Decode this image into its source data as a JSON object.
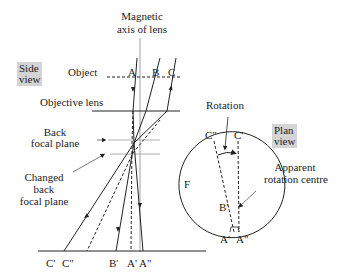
{
  "side_view": {
    "tag_line1": "Side",
    "tag_line2": "view",
    "axis_label_line1": "Magnetic",
    "axis_label_line2": "axis of lens",
    "object_label": "Object",
    "objective_lens_label": "Objective lens",
    "back_focal_plane_line1": "Back",
    "back_focal_plane_line2": "focal plane",
    "changed_bfp_line1": "Changed",
    "changed_bfp_line2": "back",
    "changed_bfp_line3": "focal plane",
    "object_points": [
      "A",
      "B",
      "C"
    ],
    "image_points": [
      "C'",
      "C\"",
      "B'",
      "A'",
      "A\""
    ]
  },
  "plan_view": {
    "tag_line1": "Plan",
    "tag_line2": "view",
    "rotation_label": "Rotation",
    "apparent_centre_line1": "Apparent",
    "apparent_centre_line2": "rotation centre",
    "circle_label": "F",
    "points": {
      "c_double": "C\"",
      "c_prime": "C'",
      "b_prime": "B'",
      "a_prime": "A'",
      "a_double": "A\""
    }
  },
  "colors": {
    "line": "#222222",
    "tag_background": "#d4d4d4",
    "guide_line": "#999999"
  }
}
